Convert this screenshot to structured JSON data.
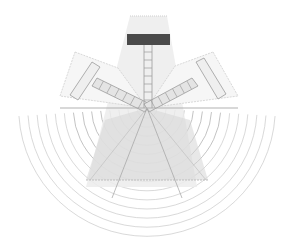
{
  "diagram": {
    "elements": {
      "central_block": {
        "label": "central-stage-block",
        "color": "#4a4a4a"
      },
      "beam": {
        "label": "central-beam",
        "color": "#e6e6e6"
      },
      "left_wing": {
        "label": "left-wing"
      },
      "right_wing": {
        "label": "right-wing"
      },
      "lower_fan": {
        "label": "lower-shaded-fan",
        "color": "#dcdcdc"
      },
      "arcs": {
        "label": "concentric-arcs",
        "count": 14,
        "color": "#bdbdbd"
      },
      "baseline": {
        "label": "horizontal-baseline"
      }
    },
    "colors": {
      "background": "#ffffff",
      "dark_block": "#4a4a4a",
      "light_fill": "#ececec",
      "mid_fill": "#dedede",
      "line": "#a8a8a8",
      "arc": "#c4c4c4"
    }
  }
}
